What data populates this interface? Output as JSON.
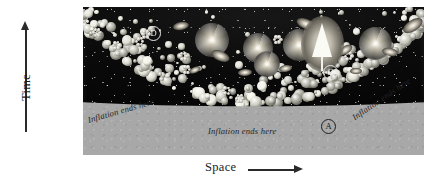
{
  "figure": {
    "type": "cosmology-inflation-spacetime-diagram",
    "background_color": "#ffffff",
    "panel_color": "#a8a8a8",
    "universe_color": "#0a0a0a",
    "accent_color": "#2a2a2a"
  },
  "axes": {
    "y": {
      "label": "Time",
      "arrow": "up-arrow-icon",
      "direction": "up"
    },
    "x": {
      "label": "Space",
      "arrow": "right-arrow-icon",
      "direction": "right"
    }
  },
  "annotations": {
    "inflation_left": {
      "text": "Inflation ends here",
      "rotation_deg": -16
    },
    "inflation_center": {
      "text": "Inflation ends here",
      "rotation_deg": 0
    },
    "inflation_right": {
      "text": "Inflation ends here",
      "rotation_deg": -34
    }
  },
  "callouts": [
    {
      "id": "A",
      "label": "A",
      "region": "light",
      "description": "gray region right of center boundary"
    },
    {
      "id": "B",
      "label": "B",
      "region": "light",
      "description": "gray region left of center boundary"
    },
    {
      "id": "C",
      "label": "C",
      "region": "dark",
      "description": "dark universe right of center"
    },
    {
      "id": "D",
      "label": "D",
      "region": "dark",
      "description": "dark universe upper left"
    }
  ],
  "lightcone": {
    "name": "light-cone",
    "shape": "triangle",
    "color": "#fbfbf6"
  },
  "galaxies": [
    {
      "id": "g1",
      "kind": "spiral",
      "x": 112,
      "y": 16,
      "size": 34
    },
    {
      "id": "g2",
      "kind": "spiral",
      "x": 160,
      "y": 26,
      "size": 30
    },
    {
      "id": "g3",
      "kind": "spiral",
      "x": 200,
      "y": 22,
      "size": 32
    },
    {
      "id": "g4",
      "kind": "spiral",
      "x": 276,
      "y": 20,
      "size": 33
    },
    {
      "id": "g5",
      "kind": "spiral",
      "x": 171,
      "y": 44,
      "size": 26
    },
    {
      "id": "g6",
      "kind": "elliptical",
      "x": 90,
      "y": 15,
      "size": 16
    },
    {
      "id": "g7",
      "kind": "elliptical",
      "x": 128,
      "y": 44,
      "size": 19
    },
    {
      "id": "g8",
      "kind": "elliptical",
      "x": 213,
      "y": 12,
      "size": 20
    },
    {
      "id": "g9",
      "kind": "elliptical",
      "x": 232,
      "y": 48,
      "size": 18
    },
    {
      "id": "g10",
      "kind": "elliptical",
      "x": 255,
      "y": 39,
      "size": 15
    },
    {
      "id": "g11",
      "kind": "elliptical",
      "x": 299,
      "y": 41,
      "size": 16
    },
    {
      "id": "g12",
      "kind": "elliptical",
      "x": 319,
      "y": 13,
      "size": 22
    },
    {
      "id": "g13",
      "kind": "elliptical",
      "x": 155,
      "y": 62,
      "size": 14
    },
    {
      "id": "g14",
      "kind": "elliptical",
      "x": 196,
      "y": 58,
      "size": 13
    },
    {
      "id": "g15",
      "kind": "elliptical",
      "x": 106,
      "y": 60,
      "size": 12
    },
    {
      "id": "g16",
      "kind": "elliptical",
      "x": 267,
      "y": 61,
      "size": 12
    }
  ]
}
